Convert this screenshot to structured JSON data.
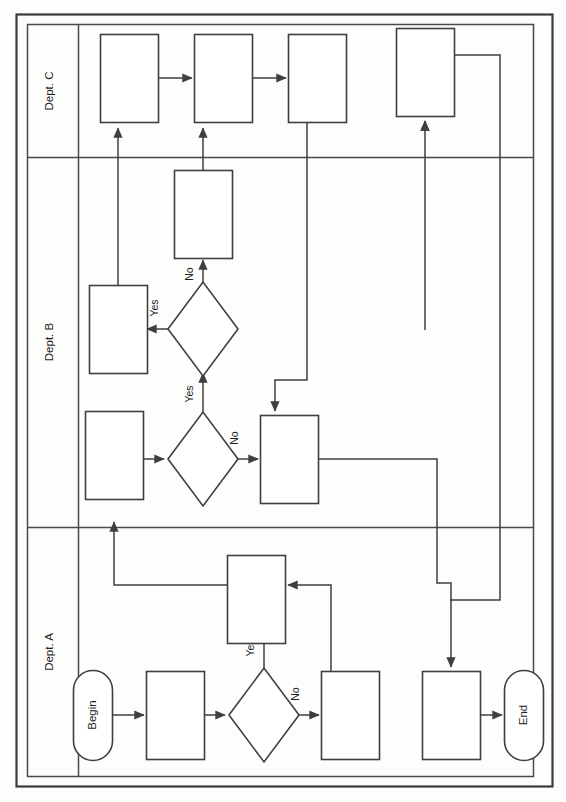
{
  "diagram": {
    "type": "cross-functional-swimlane-flowchart",
    "orientation": "rotated-90-counterclockwise",
    "page_width": 566,
    "page_height": 802,
    "colors": {
      "background": "#fdfdfc",
      "stroke": "#3f3f3f",
      "frame": "#3a3a3a",
      "text": "#1c1c1c",
      "node_fill": "#ffffff"
    }
  },
  "lanes": [
    {
      "id": "dept-c",
      "label": "Dept. C"
    },
    {
      "id": "dept-b",
      "label": "Dept. B"
    },
    {
      "id": "dept-a",
      "label": "Dept. A"
    }
  ],
  "terminators": [
    {
      "id": "begin",
      "label": "Begin",
      "lane": "dept-a"
    },
    {
      "id": "end",
      "label": "End",
      "lane": "dept-a"
    }
  ],
  "edge_labels": {
    "a_decision_yes": "Yes",
    "a_decision_no": "No",
    "b_decision1_yes": "Yes",
    "b_decision1_no": "No",
    "b_decision2_yes": "Yes",
    "b_decision2_no": "No"
  },
  "nodes": {
    "dept_a": [
      {
        "id": "a-process-1",
        "shape": "process",
        "label": ""
      },
      {
        "id": "a-decision-1",
        "shape": "decision",
        "label": ""
      },
      {
        "id": "a-process-2",
        "shape": "process",
        "label": ""
      },
      {
        "id": "a-process-3",
        "shape": "process",
        "label": ""
      },
      {
        "id": "a-process-4",
        "shape": "process",
        "label": ""
      }
    ],
    "dept_b": [
      {
        "id": "b-process-1",
        "shape": "process",
        "label": ""
      },
      {
        "id": "b-decision-1",
        "shape": "decision",
        "label": ""
      },
      {
        "id": "b-process-2",
        "shape": "process",
        "label": ""
      },
      {
        "id": "b-decision-2",
        "shape": "decision",
        "label": ""
      },
      {
        "id": "b-process-3",
        "shape": "process",
        "label": ""
      },
      {
        "id": "b-process-4",
        "shape": "process",
        "label": ""
      }
    ],
    "dept_c": [
      {
        "id": "c-process-1",
        "shape": "process",
        "label": ""
      },
      {
        "id": "c-process-2",
        "shape": "process",
        "label": ""
      },
      {
        "id": "c-process-3",
        "shape": "process",
        "label": ""
      },
      {
        "id": "c-process-4",
        "shape": "process",
        "label": ""
      }
    ]
  }
}
